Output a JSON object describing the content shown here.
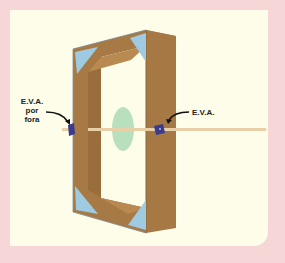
{
  "diagram": {
    "labels": {
      "left_line1": "E.V.A.",
      "left_line2": "por",
      "left_line3": "fora",
      "right": "E.V.A."
    },
    "colors": {
      "outer_background": "#f6d6d6",
      "panel_background": "#fefde9",
      "frame_wood": "#a77a45",
      "frame_wood_dark": "#8e6535",
      "frame_wood_light": "#b88a52",
      "corner_braces": "#9fcbe2",
      "disc": "#b8e0bc",
      "axle": "#e8cfa8",
      "eva_pad": "#3c3a8c"
    },
    "parts": [
      "wooden-frame",
      "corner-braces",
      "axle-stick",
      "green-disc",
      "eva-pad-left",
      "eva-pad-right"
    ]
  }
}
